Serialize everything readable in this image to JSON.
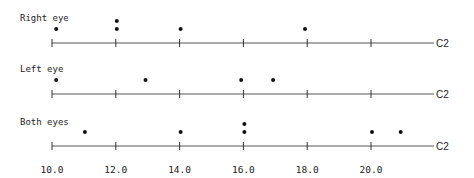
{
  "chart_data": {
    "type": "scatter",
    "subtype": "dotplot",
    "title": "",
    "xlabel": "C2",
    "ylabel": "",
    "xlim": [
      10.0,
      21.5
    ],
    "x_ticks": [
      10.0,
      12.0,
      14.0,
      16.0,
      18.0,
      20.0
    ],
    "x_tick_labels": [
      "10.0",
      "12.0",
      "14.0",
      "16.0",
      "18.0",
      "20.0"
    ],
    "grid": false,
    "legend": null,
    "panels": [
      {
        "name": "Right eye",
        "values": [
          10.1,
          12.0,
          12.0,
          14.0,
          17.9
        ]
      },
      {
        "name": "Left eye",
        "values": [
          10.1,
          12.9,
          15.9,
          16.9
        ]
      },
      {
        "name": "Both eyes",
        "values": [
          11.0,
          14.0,
          16.0,
          16.0,
          20.0,
          20.9
        ]
      }
    ]
  },
  "colors": {
    "dot": "#111111",
    "axis": "#555555",
    "text": "#222222"
  }
}
